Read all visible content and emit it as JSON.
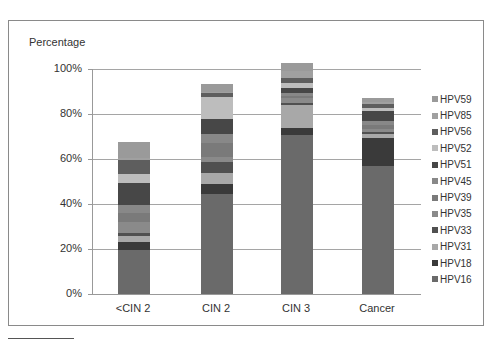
{
  "chart_data": {
    "type": "bar",
    "stacked": true,
    "title": "",
    "xlabel": "",
    "ylabel": "Percentage",
    "ylim": [
      0,
      100
    ],
    "yticks": [
      "0%",
      "20%",
      "40%",
      "60%",
      "80%",
      "100%"
    ],
    "grid": true,
    "legend_position": "right",
    "categories": [
      "<CIN 2",
      "CIN 2",
      "CIN 3",
      "Cancer"
    ],
    "series": [
      {
        "name": "HPV16",
        "color": "#6a6a6a",
        "values": [
          19.5,
          44.5,
          70.5,
          57.0
        ]
      },
      {
        "name": "HPV18",
        "color": "#3a3a3a",
        "values": [
          3.5,
          4.5,
          3.5,
          12.5
        ]
      },
      {
        "name": "HPV31",
        "color": "#a8a8a8",
        "values": [
          3.0,
          5.0,
          10.0,
          1.5
        ]
      },
      {
        "name": "HPV33",
        "color": "#505050",
        "values": [
          1.0,
          4.5,
          1.0,
          1.0
        ]
      },
      {
        "name": "HPV35",
        "color": "#8a8a8a",
        "values": [
          5.0,
          2.5,
          2.0,
          1.5
        ]
      },
      {
        "name": "HPV39",
        "color": "#7a7a7a",
        "values": [
          4.0,
          6.0,
          1.0,
          1.5
        ]
      },
      {
        "name": "HPV45",
        "color": "#888888",
        "values": [
          3.5,
          4.0,
          1.5,
          2.0
        ]
      },
      {
        "name": "HPV51",
        "color": "#474747",
        "values": [
          10.0,
          7.0,
          2.0,
          4.5
        ]
      },
      {
        "name": "HPV52",
        "color": "#bdbdbd",
        "values": [
          4.0,
          9.5,
          2.5,
          1.0
        ]
      },
      {
        "name": "HPV56",
        "color": "#5e5e5e",
        "values": [
          6.0,
          2.0,
          2.0,
          2.0
        ]
      },
      {
        "name": "HPV85",
        "color": "#a0a0a0",
        "values": [
          1.0,
          0.5,
          3.0,
          1.0
        ]
      },
      {
        "name": "HPV59",
        "color": "#9a9a9a",
        "values": [
          7.0,
          3.5,
          3.5,
          1.5
        ]
      }
    ],
    "totals_approx": [
      68,
      93,
      99,
      87
    ]
  },
  "legend": {
    "items": [
      "HPV59",
      "HPV85",
      "HPV56",
      "HPV52",
      "HPV51",
      "HPV45",
      "HPV39",
      "HPV35",
      "HPV33",
      "HPV31",
      "HPV18",
      "HPV16"
    ]
  }
}
